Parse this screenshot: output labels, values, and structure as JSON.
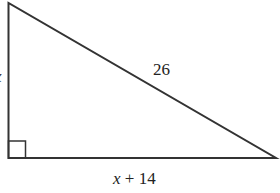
{
  "figure": {
    "type": "right-triangle",
    "hypotenuse_label": "26",
    "base_label_var": "x",
    "base_label_rest": " + 14",
    "height_label": "x",
    "right_angle_marker": "bottom-left",
    "stroke_color": "#333333",
    "background": "#ffffff"
  }
}
